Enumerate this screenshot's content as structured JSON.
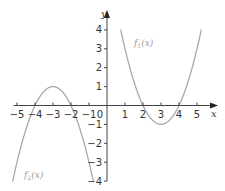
{
  "chart_data": {
    "type": "line",
    "title": "",
    "xlabel": "x",
    "ylabel": "y",
    "xlim": [
      -5.3,
      5.7
    ],
    "ylim": [
      -4,
      4.5
    ],
    "grid": false,
    "x_ticks": [
      -5,
      -4,
      -3,
      -2,
      -1,
      0,
      1,
      2,
      3,
      4,
      5
    ],
    "y_ticks": [
      -4,
      -3,
      -2,
      -1,
      1,
      2,
      3,
      4
    ],
    "origin_label": "0",
    "series": [
      {
        "name": "f1(x)",
        "label_main": "f",
        "label_sub": "1",
        "label_tail": "(x)",
        "formula": "(x-2)(x-4)",
        "vertex": [
          3,
          -1
        ],
        "roots": [
          2,
          4
        ],
        "x_range": [
          0.76,
          5.24
        ],
        "points": [
          [
            0.76,
            4
          ],
          [
            1,
            3
          ],
          [
            2,
            0
          ],
          [
            3,
            -1
          ],
          [
            4,
            0
          ],
          [
            5,
            3
          ],
          [
            5.24,
            4
          ]
        ],
        "color": "#a8a8a8"
      },
      {
        "name": "f2(x)",
        "label_main": "f",
        "label_sub": "2",
        "label_tail": "(x)",
        "formula": "-(x+2)(x+4)",
        "vertex": [
          -3,
          1
        ],
        "roots": [
          -4,
          -2
        ],
        "x_range": [
          -5.24,
          -0.76
        ],
        "points": [
          [
            -5.24,
            -4
          ],
          [
            -5,
            -3
          ],
          [
            -4,
            0
          ],
          [
            -3,
            1
          ],
          [
            -2,
            0
          ],
          [
            -1,
            -3
          ],
          [
            -0.76,
            -4
          ]
        ],
        "color": "#a8a8a8"
      }
    ],
    "legend": "inline labels near curves"
  },
  "colors": {
    "axis": "#444444",
    "curve": "#a8a8a8",
    "text": "#333333",
    "curve_label": "#9a9a9a"
  }
}
